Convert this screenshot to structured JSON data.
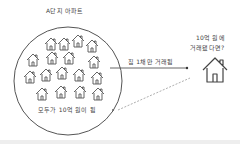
{
  "diagram": {
    "title": "A단지 아파트",
    "group_caption": "모두가 10억 원이 됨",
    "arrow_label": "집 1채만 거래됨",
    "question": [
      "10억 원에",
      "거래됐다면?"
    ],
    "houses_in_complex": 18,
    "colors": {
      "stroke": "#555555",
      "text": "#444444",
      "dashed": "#999999",
      "bar": "#eeeeee"
    }
  }
}
